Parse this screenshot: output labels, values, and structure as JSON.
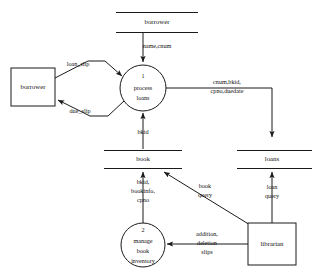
{
  "diagram": {
    "type": "data-flow-diagram",
    "background_color": "#ffffff",
    "line_color": "#1a1a1a",
    "text_color": "#111111"
  },
  "data_stores": {
    "borrower_store": {
      "label": "borrower"
    },
    "book_store": {
      "label": "book"
    },
    "loans_store": {
      "label": "loans"
    }
  },
  "external_entities": {
    "borrower_entity": {
      "label": "borrower"
    },
    "librarian_entity": {
      "label": "librarian"
    }
  },
  "processes": {
    "process_1": {
      "number": "1",
      "line1": "process",
      "line2": "loans"
    },
    "process_2": {
      "number": "2",
      "line1": "manage",
      "line2": "book",
      "line3": "inventory"
    }
  },
  "flows": {
    "name_cnum": {
      "label": "name,cnum"
    },
    "loan_slip": {
      "label": "loan_slip"
    },
    "due_slip": {
      "label": "due_slip"
    },
    "cnum_bkid": {
      "line1": "cnum,bkid,",
      "line2": "cpno,duedate"
    },
    "bkid": {
      "label": "bkid"
    },
    "bkid_bookinfo_cpno": {
      "line1": "bkid,",
      "line2": "bookinfo,",
      "line3": "cpno"
    },
    "book_query": {
      "line1": "book",
      "line2": "query"
    },
    "loan_query": {
      "line1": "loan",
      "line2": "query"
    },
    "addition_deletion_slips": {
      "line1": "addition,",
      "line2": "deletion",
      "line3": "slips"
    }
  }
}
